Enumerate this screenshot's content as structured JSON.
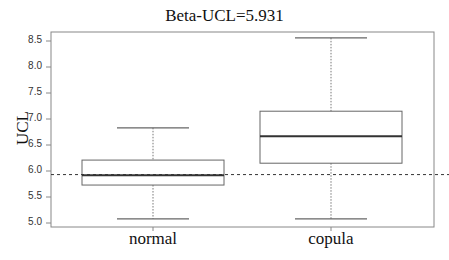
{
  "chart_data": {
    "type": "box",
    "title": "Beta-UCL=5.931",
    "xlabel": "",
    "ylabel": "UCL",
    "ylim": [
      4.96,
      8.67
    ],
    "yticks": [
      "5.0",
      "5.5",
      "6.0",
      "6.5",
      "7.0",
      "7.5",
      "8.0",
      "8.5"
    ],
    "categories": [
      "normal",
      "copula"
    ],
    "series": [
      {
        "name": "normal",
        "whisker_low": 5.08,
        "q1": 5.73,
        "median": 5.92,
        "q3": 6.21,
        "whisker_high": 6.83
      },
      {
        "name": "copula",
        "whisker_low": 5.08,
        "q1": 6.15,
        "median": 6.67,
        "q3": 7.15,
        "whisker_high": 8.56
      }
    ],
    "reference_line": {
      "value": 5.931,
      "style": "dashed"
    },
    "grid": false,
    "legend": "none"
  }
}
